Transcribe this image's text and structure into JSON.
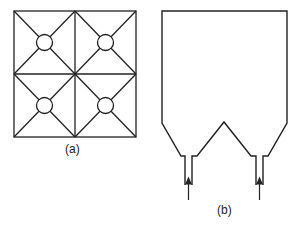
{
  "figure_a": {
    "label": "(a)",
    "description": "2x2 grid of squares, each with diagonals and a central circle"
  },
  "figure_b": {
    "label": "(b)",
    "description": "Vessel with flat top, two conical bottoms each leading to an inlet tube with upward arrow"
  },
  "colors": {
    "stroke": "#222222",
    "background": "#ffffff"
  }
}
